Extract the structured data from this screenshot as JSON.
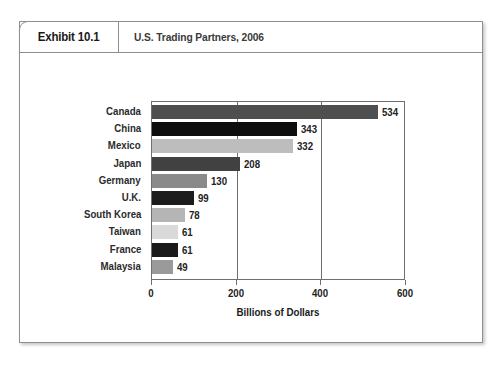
{
  "exhibit": {
    "tab_label": "Exhibit 10.1",
    "title": "U.S. Trading Partners, 2006"
  },
  "chart_data": {
    "type": "bar",
    "orientation": "horizontal",
    "title": "U.S. Trading Partners, 2006",
    "xlabel": "Billions of Dollars",
    "ylabel": "",
    "xlim": [
      0,
      600
    ],
    "xticks": [
      0,
      200,
      400,
      600
    ],
    "xtick_labels": [
      "0",
      "200",
      "400",
      "600"
    ],
    "grid": false,
    "legend": "none",
    "categories": [
      "Canada",
      "China",
      "Mexico",
      "Japan",
      "Germany",
      "U.K.",
      "South Korea",
      "Taiwan",
      "France",
      "Malaysia"
    ],
    "values": [
      534,
      343,
      332,
      208,
      130,
      99,
      78,
      61,
      61,
      49
    ],
    "value_labels": [
      "534",
      "343",
      "332",
      "208",
      "130",
      "99",
      "78",
      "61",
      "61",
      "49"
    ],
    "bar_colors": [
      "#4f4f4f",
      "#0d0d0d",
      "#bdbdbd",
      "#414141",
      "#8a8a8a",
      "#1c1c1c",
      "#b5b5b5",
      "#d9d9d9",
      "#1a1a1a",
      "#9a9a9a"
    ]
  }
}
